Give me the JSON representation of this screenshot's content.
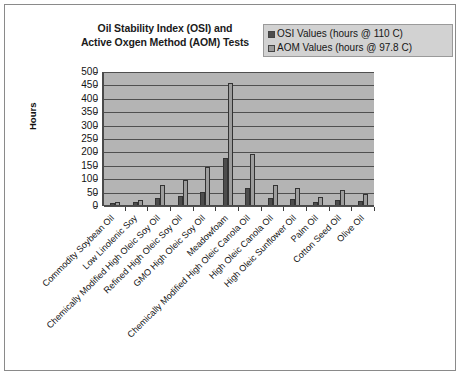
{
  "chart_data": {
    "type": "bar",
    "title": "Oil Stability Index (OSI) and Active Oxgen Method (AOM) Tests",
    "title_line1": "Oil Stability Index (OSI) and",
    "title_line2": "Active Oxgen Method (AOM) Tests",
    "xlabel": "",
    "ylabel": "Hours",
    "ylim": [
      0,
      500
    ],
    "ytick_step": 50,
    "yticks": [
      "500",
      "450",
      "400",
      "350",
      "300",
      "250",
      "200",
      "150",
      "100",
      "50",
      "0"
    ],
    "grid": true,
    "legend_position": "top-right",
    "categories": [
      "Commodity Soybean Oil",
      "Low Linolenic Soy",
      "Chemically Modified High Oleic Soy Oil",
      "Refined High Oleic Soy Oil",
      "GMO High Oleic Soy Oil",
      "Meadowfoam",
      "Chemically Modified High Oleic Canola Oil",
      "High Oleic Canola Oil",
      "High Oleic Sunflower Oil",
      "Palm Oil",
      "Cotton Seed Oil",
      "Olive Oil"
    ],
    "series": [
      {
        "name": "OSI Values (hours @ 110 C)",
        "color": "#4d4d4d",
        "values": [
          8,
          10,
          28,
          35,
          48,
          175,
          65,
          25,
          22,
          13,
          20,
          15
        ]
      },
      {
        "name": "AOM Values (hours @ 97.8 C)",
        "color": "#9d9d9d",
        "values": [
          12,
          20,
          75,
          95,
          140,
          455,
          190,
          75,
          65,
          30,
          55,
          40
        ]
      }
    ]
  },
  "legend": {
    "items": [
      {
        "label": "OSI Values (hours @ 110 C)",
        "swatch": "osi"
      },
      {
        "label": "AOM Values (hours @ 97.8 C)",
        "swatch": "aom"
      }
    ]
  },
  "colors": {
    "osi_bar": "#4d4d4d",
    "aom_bar": "#9d9d9d",
    "plot_background": "#b4b4b4",
    "legend_background": "#d2d2d2",
    "gridline": "#4f4f4f",
    "axis": "#4a4a4a"
  }
}
